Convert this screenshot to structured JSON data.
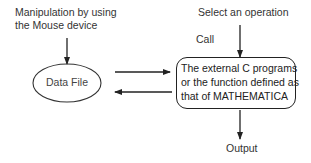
{
  "diagram": {
    "input_label": {
      "line1": "Manipulation by using",
      "line2": "the Mouse device"
    },
    "data_node": {
      "shape": "ellipse",
      "label": "Data File"
    },
    "operation_label": "Select an operation",
    "call_label": "Call",
    "process_node": {
      "shape": "rounded-rectangle",
      "line1": "The external C programs",
      "line2": "or the function defined as",
      "line3": "that of MATHEMATICA"
    },
    "output_label": "Output",
    "edges": [
      {
        "from": "input_label",
        "to": "data_node",
        "direction": "down"
      },
      {
        "from": "data_node",
        "to": "process_node",
        "direction": "right"
      },
      {
        "from": "process_node",
        "to": "data_node",
        "direction": "left"
      },
      {
        "from": "operation_label",
        "to": "process_node",
        "direction": "down"
      },
      {
        "from": "process_node",
        "to": "output_label",
        "direction": "down"
      }
    ],
    "colors": {
      "line": "#222222",
      "text": "#333333",
      "background": "#ffffff"
    }
  }
}
